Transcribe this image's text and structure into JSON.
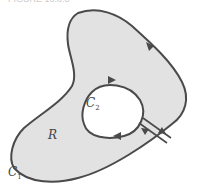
{
  "figure": {
    "caption_fragment": "FIGURE 16.8.3",
    "region_label": "R",
    "outer_curve": {
      "letter": "C",
      "subscript": "1"
    },
    "inner_curve": {
      "letter": "C",
      "subscript": "2"
    }
  },
  "colors": {
    "region_fill": "#e2e2e2",
    "stroke": "#4a4a4a",
    "background": "#ffffff"
  }
}
